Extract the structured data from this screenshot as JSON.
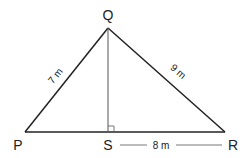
{
  "diagram": {
    "type": "triangle",
    "vertices": {
      "Q": {
        "label": "Q"
      },
      "P": {
        "label": "P"
      },
      "R": {
        "label": "R"
      },
      "S": {
        "label": "S"
      }
    },
    "measurements": {
      "PQ": "7 m",
      "QR": "9 m",
      "SR": "8 m"
    },
    "right_angle_at": "S",
    "colors": {
      "line": "#222222",
      "altitude": "#555555",
      "background": "#ffffff"
    }
  }
}
